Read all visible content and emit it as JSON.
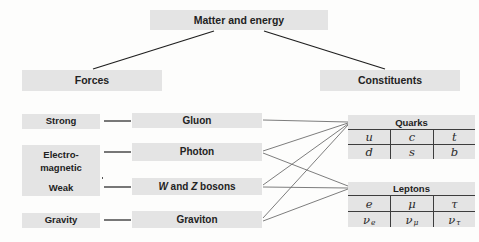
{
  "colors": {
    "background": "#fdfdfc",
    "box_fill": "#e4e4e4",
    "text": "#222222",
    "tree_line": "#1f1f1f",
    "fan_line": "#6e6e6e",
    "table_rule": "#3d3d3d"
  },
  "root_label": "Matter and energy",
  "branches": {
    "forces_label": "Forces",
    "constituents_label": "Constituents"
  },
  "forces": {
    "strong": "Strong",
    "electromagnetic_line1": "Electro-",
    "electromagnetic_line2": "magnetic",
    "weak": "Weak",
    "gravity": "Gravity"
  },
  "carriers": {
    "gluon": "Gluon",
    "photon": "Photon",
    "wz": {
      "w": "W",
      "and": " and ",
      "z": "Z",
      "bosons": " bosons"
    },
    "graviton": "Graviton"
  },
  "quarks_table": {
    "title": "Quarks",
    "rows": [
      [
        "u",
        "c",
        "t"
      ],
      [
        "d",
        "s",
        "b"
      ]
    ]
  },
  "leptons_table": {
    "title": "Leptons",
    "rows": [
      [
        "e",
        "μ",
        "τ"
      ],
      [
        {
          "b": "ν",
          "s": "e"
        },
        {
          "b": "ν",
          "s": "μ"
        },
        {
          "b": "ν",
          "s": "τ"
        }
      ]
    ]
  },
  "edges": [
    {
      "name": "edge-matter-forces",
      "kind": "tree",
      "x1": 214,
      "y1": 31,
      "x2": 93,
      "y2": 69
    },
    {
      "name": "edge-matter-constituents",
      "kind": "tree",
      "x1": 264,
      "y1": 31,
      "x2": 385,
      "y2": 69
    },
    {
      "name": "edge-strong-gluon",
      "kind": "tree",
      "x1": 104,
      "y1": 121,
      "x2": 131,
      "y2": 121
    },
    {
      "name": "edge-electromagnetic-photon",
      "kind": "tree",
      "x1": 104,
      "y1": 152,
      "x2": 131,
      "y2": 152
    },
    {
      "name": "edge-weak-wz",
      "kind": "tree",
      "x1": 104,
      "y1": 187,
      "x2": 131,
      "y2": 187
    },
    {
      "name": "edge-gravity-graviton",
      "kind": "tree",
      "x1": 104,
      "y1": 220,
      "x2": 131,
      "y2": 220
    },
    {
      "name": "edge-gluon-quarks",
      "kind": "fan",
      "x1": 263,
      "y1": 120,
      "x2": 348,
      "y2": 122
    },
    {
      "name": "edge-photon-quarks",
      "kind": "fan",
      "x1": 263,
      "y1": 151,
      "x2": 348,
      "y2": 123
    },
    {
      "name": "edge-photon-leptons",
      "kind": "fan",
      "x1": 263,
      "y1": 153,
      "x2": 348,
      "y2": 186
    },
    {
      "name": "edge-wz-quarks",
      "kind": "fan",
      "x1": 263,
      "y1": 185,
      "x2": 348,
      "y2": 124
    },
    {
      "name": "edge-wz-leptons",
      "kind": "fan",
      "x1": 263,
      "y1": 187,
      "x2": 348,
      "y2": 188
    },
    {
      "name": "edge-graviton-quarks",
      "kind": "fan",
      "x1": 263,
      "y1": 218,
      "x2": 348,
      "y2": 125
    },
    {
      "name": "edge-graviton-leptons",
      "kind": "fan",
      "x1": 263,
      "y1": 221,
      "x2": 348,
      "y2": 189
    },
    {
      "name": "electroweak-dashed-divider",
      "kind": "dashed",
      "x1": 22,
      "y1": 178,
      "x2": 103,
      "y2": 178
    }
  ]
}
